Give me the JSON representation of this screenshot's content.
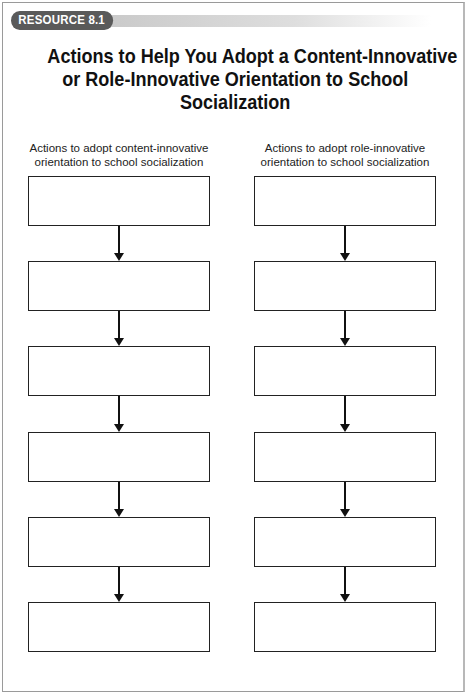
{
  "resource": {
    "label": "RESOURCE 8.1"
  },
  "title": {
    "lines": [
      "Actions to Help You Adopt a Content-Innovative",
      "or Role-Innovative Orientation to School",
      "Socialization"
    ]
  },
  "columns": [
    {
      "heading_lines": [
        "Actions to adopt content-innovative",
        "orientation to school socialization"
      ],
      "box_count": 6
    },
    {
      "heading_lines": [
        "Actions to adopt role-innovative",
        "orientation to school socialization"
      ],
      "box_count": 6
    }
  ],
  "colors": {
    "pill_background": "#5a5a5a",
    "pill_text": "#ffffff",
    "box_stroke": "#222222"
  }
}
